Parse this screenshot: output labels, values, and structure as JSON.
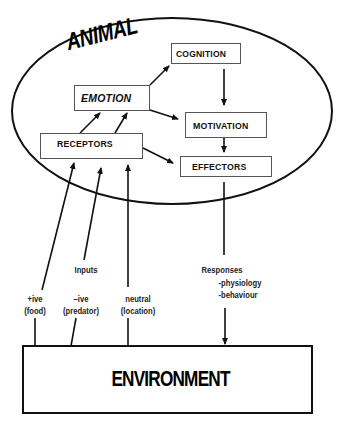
{
  "diagram": {
    "container_label": "ANIMAL",
    "environment_label": "ENVIRONMENT",
    "nodes": {
      "cognition": "COGNITION",
      "emotion": "EMOTION",
      "motivation": "MOTIVATION",
      "receptors": "RECEPTORS",
      "effectors": "EFFECTORS"
    },
    "edges": [
      {
        "from": "receptors",
        "to": "emotion"
      },
      {
        "from": "receptors",
        "to": "emotion"
      },
      {
        "from": "receptors",
        "to": "effectors"
      },
      {
        "from": "emotion",
        "to": "cognition"
      },
      {
        "from": "emotion",
        "to": "motivation"
      },
      {
        "from": "cognition",
        "to": "motivation"
      },
      {
        "from": "motivation",
        "to": "effectors"
      },
      {
        "from": "environment",
        "to": "receptors",
        "label": "+ive (food)"
      },
      {
        "from": "environment",
        "to": "receptors",
        "label": "-ive (predator)"
      },
      {
        "from": "environment",
        "to": "receptors",
        "label": "neutral (location)"
      },
      {
        "from": "effectors",
        "to": "environment",
        "label": "Responses"
      }
    ],
    "inputs": {
      "heading": "Inputs",
      "positive_line1": "+ive",
      "positive_line2": "(food)",
      "negative_line1": "–ive",
      "negative_line2": "(predator)",
      "neutral_line1": "neutral",
      "neutral_line2": "(location)"
    },
    "responses": {
      "heading": "Responses",
      "item1": "-physiology",
      "item2": "-behaviour"
    }
  }
}
